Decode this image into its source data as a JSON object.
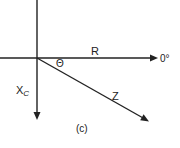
{
  "diagram": {
    "caption": "(c)",
    "labels": {
      "resistance": "R",
      "angle": "Θ",
      "reactance_main": "X",
      "reactance_sub": "C",
      "impedance": "Z",
      "reference_angle": "0°"
    },
    "colors": {
      "line": "#222222",
      "background": "#ffffff"
    },
    "geometry": {
      "origin": [
        37,
        58
      ],
      "horizontal_axis": {
        "from": [
          0,
          58
        ],
        "to": [
          156,
          58
        ]
      },
      "vertical_axis": {
        "from": [
          37,
          0
        ],
        "to": [
          37,
          120
        ]
      },
      "impedance_vector": {
        "from": [
          37,
          58
        ],
        "to": [
          148,
          121
        ]
      }
    }
  }
}
